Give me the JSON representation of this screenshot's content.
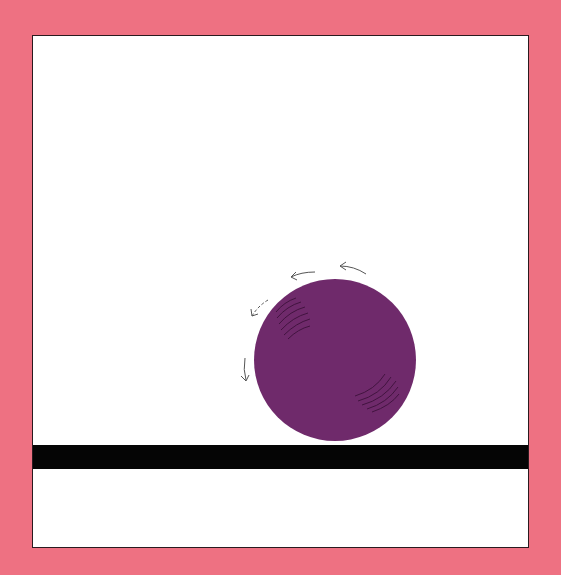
{
  "illustration": {
    "caption": "Purple ball rolling on a black surface",
    "colors": {
      "background": "#ee7182",
      "panel": "#ffffff",
      "ball": "#6f2a6b",
      "ball_shading": "#3a1038",
      "surface": "#050505",
      "arrows": "#555555"
    },
    "ball": {
      "cx": 335,
      "cy": 360,
      "r": 81
    },
    "motion": "counter-clockwise rotation arrows"
  }
}
